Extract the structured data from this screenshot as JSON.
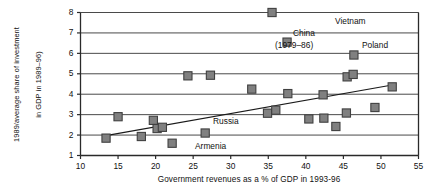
{
  "chart_data": {
    "type": "scatter",
    "title": "",
    "xlabel": "Government revenues as a % of GDP in 1993-96",
    "ylabel": "MCP (GDP in 1998 as a  % of 1989/average share of investment in GDP in 1989–96)",
    "ylabel_lines": [
      "MCP (GDP in 1998 as a  % of",
      "1989/average share of investment",
      "in GDP in 1989–96)"
    ],
    "xlim": [
      10,
      55
    ],
    "ylim": [
      1,
      8
    ],
    "xticks": [
      10,
      15,
      20,
      25,
      30,
      35,
      40,
      45,
      50,
      55
    ],
    "yticks": [
      1,
      2,
      3,
      4,
      5,
      6,
      7,
      8
    ],
    "grid": "horizontal",
    "legend": "none",
    "marker": {
      "shape": "square",
      "fill": "#808080",
      "stroke": "#404040"
    },
    "trendline": {
      "visible": true,
      "color": "#1a1a1a",
      "x": [
        13.0,
        51.5
      ],
      "y": [
        1.95,
        4.45
      ]
    },
    "points": [
      {
        "x": 13.4,
        "y": 1.85,
        "label": ""
      },
      {
        "x": 15.0,
        "y": 2.9,
        "label": ""
      },
      {
        "x": 18.1,
        "y": 1.93,
        "label": ""
      },
      {
        "x": 19.7,
        "y": 2.72,
        "label": ""
      },
      {
        "x": 20.2,
        "y": 2.32,
        "label": ""
      },
      {
        "x": 20.9,
        "y": 2.38,
        "label": ""
      },
      {
        "x": 22.2,
        "y": 1.6,
        "label": "Armenia"
      },
      {
        "x": 24.3,
        "y": 4.9,
        "label": ""
      },
      {
        "x": 26.6,
        "y": 2.1,
        "label": "Russia"
      },
      {
        "x": 27.3,
        "y": 4.93,
        "label": ""
      },
      {
        "x": 32.8,
        "y": 4.25,
        "label": ""
      },
      {
        "x": 34.9,
        "y": 3.07,
        "label": ""
      },
      {
        "x": 35.5,
        "y": 8.0,
        "label": "Vietnam"
      },
      {
        "x": 36.0,
        "y": 3.22,
        "label": ""
      },
      {
        "x": 37.5,
        "y": 6.55,
        "label": "China (1979–86)"
      },
      {
        "x": 37.6,
        "y": 4.03,
        "label": ""
      },
      {
        "x": 40.4,
        "y": 2.79,
        "label": ""
      },
      {
        "x": 42.3,
        "y": 3.97,
        "label": ""
      },
      {
        "x": 42.4,
        "y": 2.83,
        "label": ""
      },
      {
        "x": 44.0,
        "y": 2.42,
        "label": ""
      },
      {
        "x": 45.4,
        "y": 3.08,
        "label": ""
      },
      {
        "x": 45.5,
        "y": 4.85,
        "label": ""
      },
      {
        "x": 46.3,
        "y": 4.97,
        "label": ""
      },
      {
        "x": 46.4,
        "y": 5.92,
        "label": "Poland"
      },
      {
        "x": 49.2,
        "y": 3.35,
        "label": ""
      },
      {
        "x": 51.5,
        "y": 4.36,
        "label": ""
      }
    ],
    "annotations": [
      {
        "text": "Vietnam",
        "x_px": 335,
        "y_px": 16
      },
      {
        "text": "China",
        "x_px": 293,
        "y_px": 28
      },
      {
        "text": "(1979–86)",
        "x_px": 275,
        "y_px": 40
      },
      {
        "text": "Poland",
        "x_px": 362,
        "y_px": 40
      },
      {
        "text": "Russia",
        "x_px": 213,
        "y_px": 116
      },
      {
        "text": "Armenia",
        "x_px": 195,
        "y_px": 141
      }
    ]
  }
}
